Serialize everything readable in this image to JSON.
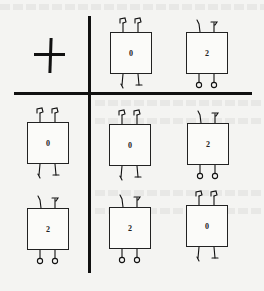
{
  "diagram": {
    "type": "operation-table",
    "operator": "+",
    "operator_icon": "plus-sign",
    "column_headers": [
      {
        "label": "0",
        "kind": "zero-creature"
      },
      {
        "label": "2",
        "kind": "two-creature"
      }
    ],
    "row_headers": [
      {
        "label": "0",
        "kind": "zero-creature"
      },
      {
        "label": "2",
        "kind": "two-creature"
      }
    ],
    "cells": [
      [
        {
          "label": "0",
          "kind": "zero-creature"
        },
        {
          "label": "2",
          "kind": "two-creature"
        }
      ],
      [
        {
          "label": "2",
          "kind": "two-creature"
        },
        {
          "label": "0",
          "kind": "zero-creature"
        }
      ]
    ]
  },
  "colors": {
    "ink": "#111111",
    "paper": "#f4f4f2"
  }
}
